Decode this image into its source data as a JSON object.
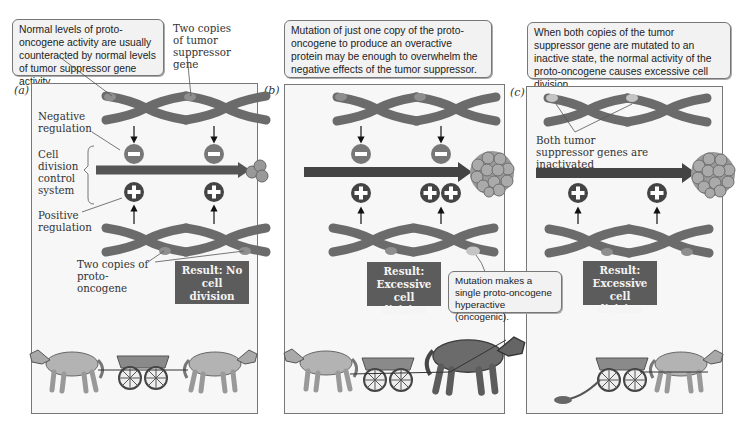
{
  "captions": {
    "a": "Normal levels of proto-oncogene activity are usually counteracted by normal levels of tumor suppressor gene activity.",
    "b": "Mutation of just one copy of the proto-oncogene to produce an overactive protein may be enough to overwhelm the negative effects of the tumor suppressor.",
    "c": "When both copies of the tumor suppressor gene are mutated to an inactive state, the normal activity of the proto-oncogene causes excessive cell division.",
    "mutation": "Mutation makes a single proto-oncogene hyperactive (oncogenic)."
  },
  "panels": {
    "a": {
      "label": "(a)",
      "result": "Result: No cell division"
    },
    "b": {
      "label": "(b)",
      "result": "Result: Excessive cell division"
    },
    "c": {
      "label": "(c)",
      "result": "Result: Excessive cell division"
    }
  },
  "labels": {
    "two_copies_tumor": "Two copies of tumor suppressor gene",
    "negative_regulation": "Negative regulation",
    "cell_division_control": "Cell division control system",
    "positive_regulation": "Positive regulation",
    "two_copies_proto": "Two copies of proto-oncogene",
    "both_inactivated": "Both tumor suppressor genes are inactivated"
  },
  "colors": {
    "chromosome": "#6b6b6b",
    "tip_normal": "#8e8e8e",
    "tip_mutant": "#c4c4c4",
    "arrow": "#4a4a4a",
    "minus_circle": "#777777",
    "plus_circle": "#444444",
    "result_bg": "#5c5c5c",
    "panel_bg": "#f7f7f7"
  }
}
